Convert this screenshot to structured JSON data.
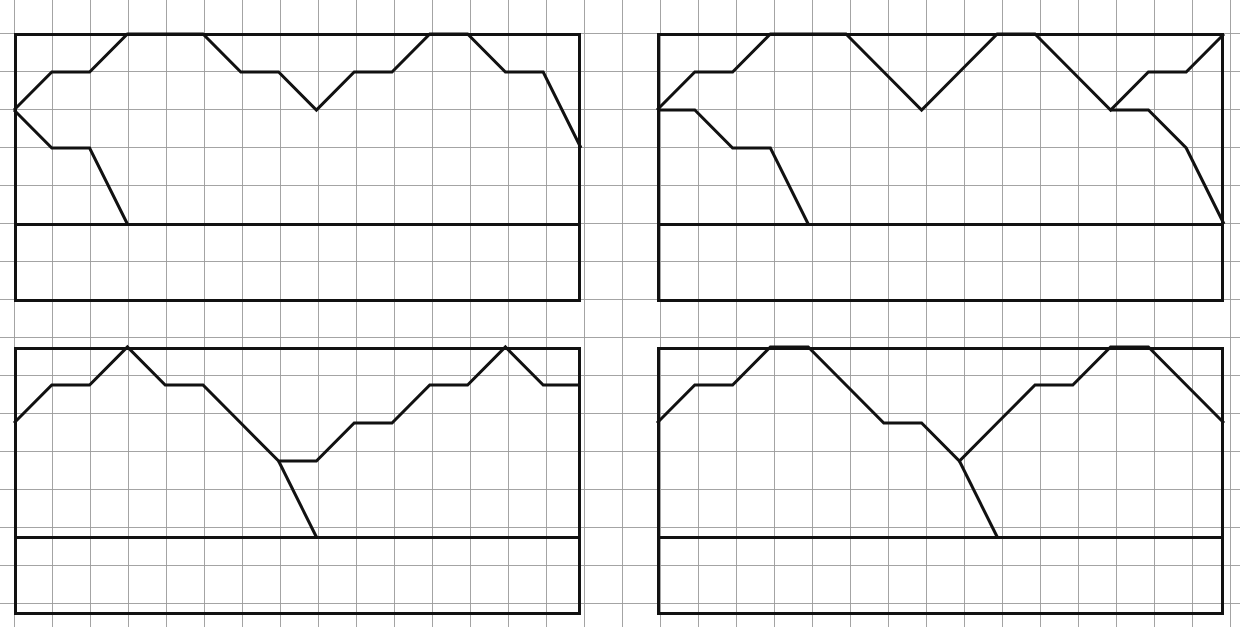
{
  "canvas": {
    "width": 1240,
    "height": 627,
    "background": "#ffffff"
  },
  "grid": {
    "cell_size": 38,
    "origin_x": 14,
    "origin_y": 33,
    "line_color": "#9a9a9a",
    "line_width": 0.9,
    "description": "light graph-paper grid covering the full page"
  },
  "style": {
    "panel_border_color": "#111111",
    "panel_border_width": 3,
    "polyline_color": "#111111",
    "polyline_width": 3,
    "baseline_color": "#111111",
    "baseline_width": 3
  },
  "chart_data": {
    "type": "line",
    "title": "",
    "subtitle": "",
    "xlabel": "",
    "ylabel": "",
    "grid": true,
    "legend_position": "none",
    "note": "Four grid-paper panels, each containing a closed baseline and a piecewise-linear profile drawn on integer grid coordinates. Units are grid cells; y increases upward from each panel's baseline row.",
    "panel_geometry": {
      "cols": 15,
      "rows_top_panel": 7,
      "rows_bottom_panel": 7,
      "baseline_row_from_top": 5
    },
    "panels": [
      {
        "id": "top-left",
        "label": "Panel 1",
        "frame": {
          "x": 14,
          "y": 33,
          "w": 567,
          "h": 269
        },
        "baseline_y": 224,
        "x_step": 37.8,
        "xlim": [
          0,
          15
        ],
        "ylim": [
          0,
          7
        ],
        "series": [
          {
            "name": "upper-profile",
            "x": [
              0,
              1,
              2,
              3,
              4,
              5,
              6,
              7,
              8,
              9,
              10,
              11,
              12,
              13,
              14,
              15
            ],
            "y": [
              3,
              4,
              4,
              5,
              5,
              5,
              4,
              4,
              3,
              4,
              4,
              5,
              5,
              4,
              4,
              2
            ]
          },
          {
            "name": "lower-profile",
            "x": [
              0,
              1,
              2,
              3
            ],
            "y": [
              3,
              2,
              2,
              0
            ]
          }
        ],
        "baseline": {
          "x": [
            0,
            15
          ],
          "y": [
            0,
            0
          ]
        }
      },
      {
        "id": "top-right",
        "label": "Panel 2",
        "frame": {
          "x": 657,
          "y": 33,
          "w": 567,
          "h": 269
        },
        "baseline_y": 224,
        "x_step": 37.8,
        "xlim": [
          0,
          15
        ],
        "ylim": [
          0,
          7
        ],
        "series": [
          {
            "name": "upper-profile",
            "x": [
              0,
              1,
              2,
              3,
              4,
              5,
              6,
              7,
              8,
              9,
              10,
              11,
              12,
              13,
              14,
              15
            ],
            "y": [
              3,
              4,
              4,
              5,
              5,
              5,
              4,
              3,
              4,
              5,
              5,
              4,
              3,
              4,
              4,
              5
            ]
          },
          {
            "name": "lower-profile",
            "x": [
              0,
              1,
              2,
              3,
              4
            ],
            "y": [
              3,
              3,
              2,
              2,
              0
            ]
          },
          {
            "name": "descent-right",
            "x": [
              12,
              13,
              14,
              15
            ],
            "y": [
              3,
              3,
              2,
              0
            ]
          }
        ],
        "baseline": {
          "x": [
            0,
            15
          ],
          "y": [
            0,
            0
          ]
        }
      },
      {
        "id": "bottom-left",
        "label": "Panel 3",
        "frame": {
          "x": 14,
          "y": 347,
          "w": 567,
          "h": 268
        },
        "baseline_y": 537,
        "x_step": 37.8,
        "xlim": [
          0,
          15
        ],
        "ylim": [
          0,
          7
        ],
        "series": [
          {
            "name": "profile",
            "x": [
              0,
              1,
              2,
              3,
              4,
              5,
              6,
              7,
              8,
              9,
              10,
              11,
              12,
              13,
              14,
              15
            ],
            "y": [
              3,
              4,
              4,
              5,
              4,
              4,
              3,
              2,
              2,
              3,
              3,
              4,
              4,
              5,
              4,
              4
            ]
          },
          {
            "name": "valley-dip",
            "x": [
              7,
              8
            ],
            "y": [
              2,
              0
            ]
          }
        ],
        "baseline": {
          "x": [
            0,
            15
          ],
          "y": [
            0,
            0
          ]
        }
      },
      {
        "id": "bottom-right",
        "label": "Panel 4",
        "frame": {
          "x": 657,
          "y": 347,
          "w": 567,
          "h": 268
        },
        "baseline_y": 537,
        "x_step": 37.8,
        "xlim": [
          0,
          15
        ],
        "ylim": [
          0,
          7
        ],
        "series": [
          {
            "name": "profile",
            "x": [
              0,
              1,
              2,
              3,
              4,
              5,
              6,
              7,
              8,
              9,
              10,
              11,
              12,
              13,
              14,
              15
            ],
            "y": [
              3,
              4,
              4,
              5,
              5,
              4,
              3,
              3,
              2,
              3,
              4,
              4,
              5,
              5,
              4,
              3
            ]
          },
          {
            "name": "valley-dip",
            "x": [
              8,
              9
            ],
            "y": [
              2,
              0
            ]
          }
        ],
        "baseline": {
          "x": [
            0,
            15
          ],
          "y": [
            0,
            0
          ]
        }
      }
    ]
  }
}
